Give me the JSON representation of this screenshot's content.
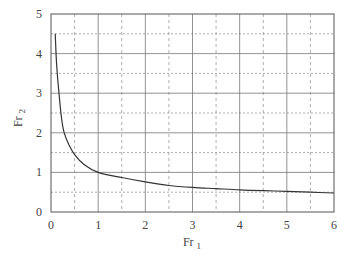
{
  "chart_data": {
    "type": "line",
    "title": "",
    "xlabel": "Fr 1",
    "ylabel": "Fr 2",
    "xlabel_main": "Fr",
    "xlabel_sub": "1",
    "ylabel_main": "Fr",
    "ylabel_sub": "2",
    "xlim": [
      0,
      6
    ],
    "ylim": [
      0,
      5
    ],
    "x_ticks": [
      "0",
      "1",
      "2",
      "3",
      "4",
      "5",
      "6"
    ],
    "y_ticks": [
      "0",
      "1",
      "2",
      "3",
      "4",
      "5"
    ],
    "grid": {
      "major": "solid",
      "minor": "dotted",
      "minor_step_x": 0.5,
      "minor_step_y": 0.5
    },
    "legend": null,
    "series": [
      {
        "name": "Fr2 vs Fr1",
        "x": [
          0.09,
          0.12,
          0.17,
          0.22,
          0.28,
          0.38,
          0.5,
          0.7,
          1.0,
          1.5,
          2.0,
          2.5,
          3.0,
          3.5,
          4.0,
          4.5,
          5.0,
          5.5,
          6.0
        ],
        "y": [
          4.5,
          3.7,
          3.0,
          2.4,
          2.0,
          1.7,
          1.45,
          1.2,
          1.0,
          0.87,
          0.76,
          0.67,
          0.62,
          0.59,
          0.56,
          0.54,
          0.52,
          0.5,
          0.48
        ]
      }
    ]
  }
}
